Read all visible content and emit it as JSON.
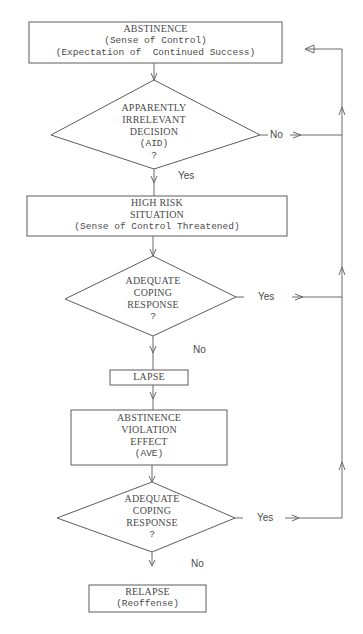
{
  "diagram": {
    "type": "flowchart",
    "nodes": {
      "abstinence": {
        "kind": "process",
        "lines": [
          "ABSTINENCE",
          "(Sense of Control)",
          "(Expectation of  Continued Success)"
        ]
      },
      "aid_decision": {
        "kind": "decision",
        "lines": [
          "APPARENTLY",
          "IRRELEVANT",
          "DECISION",
          "(AID)",
          "?"
        ]
      },
      "high_risk": {
        "kind": "process",
        "lines": [
          "HIGH RISK",
          "SITUATION",
          "(Sense of Control Threatened)"
        ]
      },
      "coping_1": {
        "kind": "decision",
        "lines": [
          "ADEQUATE",
          "COPING",
          "RESPONSE",
          "?"
        ]
      },
      "lapse": {
        "kind": "process",
        "lines": [
          "LAPSE"
        ]
      },
      "ave": {
        "kind": "process",
        "lines": [
          "ABSTINENCE",
          "VIOLATION",
          "EFFECT",
          "(AVE)"
        ]
      },
      "coping_2": {
        "kind": "decision",
        "lines": [
          "ADEQUATE",
          "COPING",
          "RESPONSE",
          "?"
        ]
      },
      "relapse": {
        "kind": "terminal",
        "lines": [
          "RELAPSE",
          "(Reoffense)"
        ]
      }
    },
    "edges": [
      {
        "from": "abstinence",
        "to": "aid_decision",
        "label": ""
      },
      {
        "from": "aid_decision",
        "to": "high_risk",
        "label": "Yes"
      },
      {
        "from": "aid_decision",
        "to": "abstinence",
        "label": "No"
      },
      {
        "from": "high_risk",
        "to": "coping_1",
        "label": ""
      },
      {
        "from": "coping_1",
        "to": "lapse",
        "label": "No"
      },
      {
        "from": "coping_1",
        "to": "abstinence",
        "label": "Yes"
      },
      {
        "from": "lapse",
        "to": "ave",
        "label": ""
      },
      {
        "from": "ave",
        "to": "coping_2",
        "label": ""
      },
      {
        "from": "coping_2",
        "to": "relapse",
        "label": "No"
      },
      {
        "from": "coping_2",
        "to": "abstinence",
        "label": "Yes"
      }
    ],
    "edge_labels": {
      "aid_no": "No",
      "aid_yes": "Yes",
      "coping1_yes": "Yes",
      "coping1_no": "No",
      "coping2_yes": "Yes",
      "coping2_no": "No"
    }
  }
}
